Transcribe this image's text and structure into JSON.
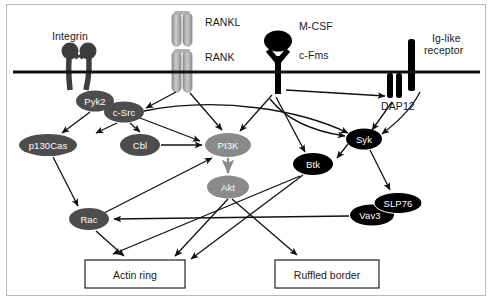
{
  "diagram": {
    "membrane": {
      "y": 72,
      "x1": 13,
      "x2": 480,
      "thickness": 3,
      "color": "#111111"
    },
    "colors": {
      "black": "#000000",
      "dark_gray": "#4d4d4d",
      "mid_gray": "#8a8a8a",
      "light_gray": "#b5b5b5",
      "receptor_gray": "#9a9a9a",
      "receptor_gray_light": "#c2c2c2",
      "text_on_node": "#ffffff",
      "label_text": "#1a1a1a",
      "arrow": "#111111"
    },
    "membrane_labels": [
      {
        "name": "integrin-label",
        "text": "Integrin",
        "x": 52,
        "y": 36
      },
      {
        "name": "rankl-label",
        "text": "RANKL",
        "x": 205,
        "y": 22
      },
      {
        "name": "rank-label",
        "text": "RANK",
        "x": 205,
        "y": 57
      },
      {
        "name": "mcsf-label",
        "text": "M-CSF",
        "x": 299,
        "y": 26
      },
      {
        "name": "cfms-label",
        "text": "c-Fms",
        "x": 299,
        "y": 55
      },
      {
        "name": "iglike-label-line1",
        "text": "Ig-like",
        "x": 436,
        "y": 38
      },
      {
        "name": "iglike-label-line2",
        "text": "receptor",
        "x": 432,
        "y": 50
      },
      {
        "name": "dap12-label",
        "text": "DAP12",
        "x": 398,
        "y": 105
      }
    ],
    "nodes": [
      {
        "name": "pyk2",
        "label": "Pyk2",
        "cx": 95,
        "cy": 101,
        "rx": 19,
        "ry": 10.5,
        "fill": "#4d4d4d"
      },
      {
        "name": "c-src",
        "label": "c-Src",
        "cx": 124,
        "cy": 112,
        "rx": 20,
        "ry": 10.5,
        "fill": "#4d4d4d"
      },
      {
        "name": "p130cas",
        "label": "p130Cas",
        "cx": 48,
        "cy": 145,
        "rx": 29,
        "ry": 11,
        "fill": "#4d4d4d"
      },
      {
        "name": "cbl",
        "label": "Cbl",
        "cx": 140,
        "cy": 145,
        "rx": 20,
        "ry": 11,
        "fill": "#4d4d4d"
      },
      {
        "name": "pi3k",
        "label": "PI3K",
        "cx": 228,
        "cy": 145,
        "rx": 23,
        "ry": 12,
        "fill": "#8a8a8a"
      },
      {
        "name": "akt",
        "label": "Akt",
        "cx": 228,
        "cy": 187,
        "rx": 21,
        "ry": 11.5,
        "fill": "#8a8a8a"
      },
      {
        "name": "btk",
        "label": "Btk",
        "cx": 313,
        "cy": 164,
        "rx": 20,
        "ry": 11,
        "fill": "#000000"
      },
      {
        "name": "syk",
        "label": "Syk",
        "cx": 364,
        "cy": 139,
        "rx": 18,
        "ry": 10.5,
        "fill": "#000000"
      },
      {
        "name": "slp76",
        "label": "SLP76",
        "cx": 398,
        "cy": 203,
        "rx": 24,
        "ry": 10.5,
        "fill": "#000000"
      },
      {
        "name": "vav3",
        "label": "Vav3",
        "cx": 372,
        "cy": 215,
        "rx": 22,
        "ry": 10.5,
        "fill": "#000000"
      },
      {
        "name": "rac",
        "label": "Rac",
        "cx": 89,
        "cy": 219,
        "rx": 20,
        "ry": 11,
        "fill": "#4d4d4d"
      }
    ],
    "outcome_boxes": [
      {
        "name": "actin-ring-box",
        "label": "Actin ring",
        "x": 85,
        "y": 260,
        "w": 100,
        "h": 28
      },
      {
        "name": "ruffled-border-box",
        "label": "Ruffled border",
        "x": 275,
        "y": 260,
        "w": 104,
        "h": 28
      }
    ],
    "receptors": [
      {
        "name": "integrin-receptor",
        "type": "integrin",
        "x": 72,
        "y": 45
      },
      {
        "name": "rankl-ligand",
        "type": "rankl",
        "x": 172,
        "y": 12
      },
      {
        "name": "rank-receptor",
        "type": "rank",
        "x": 172,
        "y": 50
      },
      {
        "name": "cfms-receptor",
        "type": "cfms",
        "x": 272,
        "y": 35
      },
      {
        "name": "iglike-receptor",
        "type": "iglike",
        "x": 410,
        "y": 38
      },
      {
        "name": "dap12-receptor",
        "type": "dap12",
        "x": 392,
        "y": 74
      }
    ],
    "edges": [
      {
        "from": "rank",
        "to": "c-src"
      },
      {
        "from": "pyk2",
        "to": "p130cas"
      },
      {
        "from": "c-src",
        "to": "p130cas"
      },
      {
        "from": "c-src",
        "to": "cbl"
      },
      {
        "from": "c-src",
        "to": "pi3k"
      },
      {
        "from": "c-src",
        "to": "syk",
        "curved": true
      },
      {
        "from": "cbl",
        "to": "pi3k"
      },
      {
        "from": "rank",
        "to": "pi3k"
      },
      {
        "from": "cfms",
        "to": "pi3k"
      },
      {
        "from": "cfms",
        "to": "btk"
      },
      {
        "from": "cfms",
        "to": "dap12"
      },
      {
        "from": "cfms",
        "to": "syk",
        "curved": true
      },
      {
        "from": "iglike",
        "to": "syk",
        "curved": true
      },
      {
        "from": "dap12",
        "to": "syk"
      },
      {
        "from": "syk",
        "to": "btk"
      },
      {
        "from": "syk",
        "to": "slp76"
      },
      {
        "from": "pi3k",
        "to": "akt"
      },
      {
        "from": "p130cas",
        "to": "rac"
      },
      {
        "from": "rac",
        "to": "pi3k"
      },
      {
        "from": "vav3",
        "to": "rac"
      },
      {
        "from": "rac",
        "to": "actin-ring"
      },
      {
        "from": "akt",
        "to": "actin-ring"
      },
      {
        "from": "akt",
        "to": "ruffled-border"
      },
      {
        "from": "btk",
        "to": "actin-ring"
      },
      {
        "from": "btk",
        "to": "ruffled-border"
      }
    ]
  }
}
